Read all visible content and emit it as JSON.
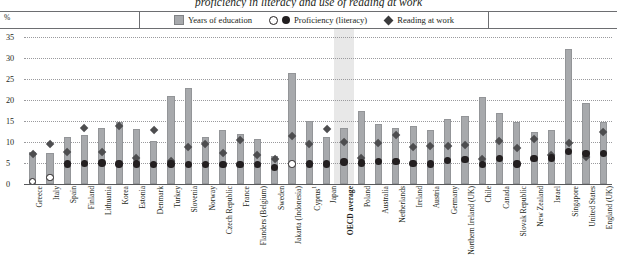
{
  "title": "proficiency in literacy and use of reading at work",
  "axis": {
    "y_unit": "%",
    "y_ticks": [
      35,
      30,
      25,
      20,
      15,
      10,
      5,
      0
    ],
    "ylim": [
      0,
      35
    ]
  },
  "legend": {
    "items": [
      {
        "label": "Years of education",
        "marker": "bar-swatch"
      },
      {
        "label": "Proficiency (literacy)",
        "marker": "open-and-filled-circle"
      },
      {
        "label": "Reading at work",
        "marker": "filled-diamond"
      }
    ]
  },
  "highlight": {
    "category": "OECD average",
    "color": "#e8e8e8"
  },
  "colors": {
    "bar": "#a7a9ac",
    "circle": "#231f20",
    "circle_open": "#ffffff",
    "diamond": "#4d4d4f",
    "grid": "#9a9a9d",
    "axis": "#58595b"
  },
  "chart_data": {
    "type": "bar",
    "title": "proficiency in literacy and use of reading at work",
    "xlabel": "",
    "ylabel": "%",
    "ylim": [
      0,
      35
    ],
    "grid": true,
    "legend_position": "top",
    "categories": [
      "Greece",
      "Italy",
      "Spain",
      "Finland",
      "Lithuania",
      "Korea",
      "Estonia",
      "Denmark",
      "Turkey",
      "Slovenia",
      "Norway",
      "Czech Republic",
      "France",
      "Flanders (Belgium)",
      "Sweden",
      "Jakarta (Indonesia)",
      "Cyprus¹",
      "Japan",
      "OECD average",
      "Poland",
      "Australia",
      "Netherlands",
      "Ireland",
      "Austria",
      "Germany",
      "Northern Ireland (UK)",
      "Chile",
      "Canada",
      "Slovak Republic",
      "New Zealand",
      "Israel",
      "Singapore",
      "United States",
      "England (UK)"
    ],
    "series": [
      {
        "name": "Years of education",
        "type": "bar",
        "values": [
          7.6,
          7.3,
          11.2,
          11.6,
          13.3,
          14.8,
          13.2,
          10.3,
          21.0,
          22.8,
          11.1,
          12.8,
          11.9,
          10.6,
          6.6,
          26.4,
          14.9,
          11.1,
          13.3,
          17.3,
          14.2,
          13.4,
          13.7,
          12.9,
          15.5,
          16.1,
          20.7,
          16.8,
          14.8,
          12.5,
          12.8,
          32.2,
          19.4,
          14.7
        ]
      },
      {
        "name": "Proficiency (literacy)",
        "type": "scatter",
        "marker": "circle",
        "values": [
          0.6,
          1.5,
          4.8,
          4.9,
          5.0,
          4.8,
          4.8,
          4.7,
          4.8,
          4.7,
          4.6,
          4.6,
          4.7,
          4.7,
          4.0,
          4.8,
          4.8,
          4.8,
          5.2,
          5.0,
          5.4,
          5.3,
          4.9,
          4.8,
          5.6,
          5.8,
          4.6,
          6.1,
          4.8,
          6.0,
          6.2,
          7.8,
          7.2,
          7.3
        ],
        "open_marker_indices": [
          0,
          1,
          15
        ]
      },
      {
        "name": "Reading at work",
        "type": "scatter",
        "marker": "diamond",
        "values": [
          7.2,
          9.4,
          7.5,
          13.4,
          7.7,
          13.9,
          6.2,
          12.9,
          5.4,
          8.8,
          9.6,
          7.3,
          10.4,
          7.0,
          6.0,
          11.5,
          9.4,
          13.1,
          9.9,
          6.2,
          9.8,
          11.7,
          8.7,
          9.1,
          9.0,
          9.3,
          5.9,
          10.3,
          8.5,
          10.6,
          6.9,
          9.8,
          6.4,
          12.3
        ]
      }
    ]
  }
}
